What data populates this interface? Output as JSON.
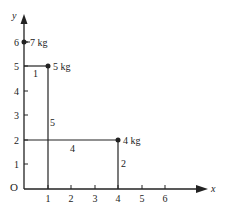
{
  "diagram": {
    "axes": {
      "x_label": "x",
      "y_label": "y",
      "origin_label": "O",
      "x_ticks": [
        "1",
        "2",
        "3",
        "4",
        "5",
        "6"
      ],
      "y_ticks": [
        "1",
        "2",
        "3",
        "4",
        "5",
        "6"
      ]
    },
    "masses": [
      {
        "label": "7 kg",
        "x": 0,
        "y": 6
      },
      {
        "label": "5 kg",
        "x": 1,
        "y": 5
      },
      {
        "label": "4 kg",
        "x": 4,
        "y": 2
      }
    ],
    "segment_labels": {
      "top": "1",
      "vertical_left": "5",
      "horizontal": "4",
      "vertical_right": "2"
    },
    "colors": {
      "ink": "#222222",
      "background": "#ffffff"
    }
  }
}
